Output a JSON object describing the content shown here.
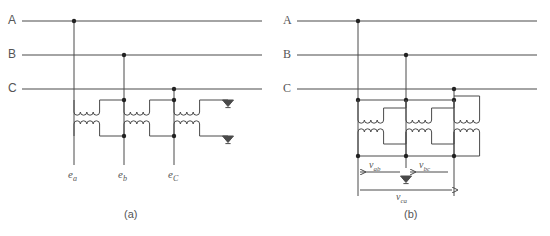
{
  "figure": {
    "background_color": "#ffffff",
    "line_color": "#4a4a4a",
    "node_color": "#222222"
  },
  "panel_a": {
    "caption": "(a)",
    "bus_labels": [
      "A",
      "B",
      "C"
    ],
    "secondary_labels": [
      {
        "symbol": "e",
        "subscript": "a"
      },
      {
        "symbol": "e",
        "subscript": "b"
      },
      {
        "symbol": "e",
        "subscript": "C"
      }
    ],
    "ground_count": 2,
    "transformer_count": 3,
    "coil_bumps": 4
  },
  "panel_b": {
    "caption": "(b)",
    "bus_labels": [
      "A",
      "B",
      "C"
    ],
    "voltage_labels": [
      {
        "symbol": "v",
        "subscript": "ab"
      },
      {
        "symbol": "v",
        "subscript": "bc"
      },
      {
        "symbol": "v",
        "subscript": "ca"
      }
    ],
    "ground_count": 1,
    "transformer_count": 3,
    "coil_bumps": 4
  }
}
